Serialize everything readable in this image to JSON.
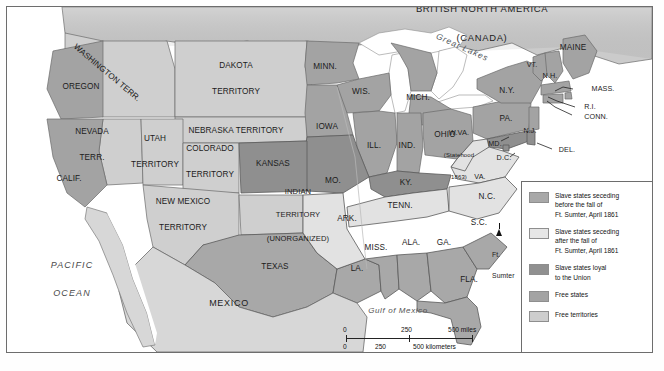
{
  "figure": {
    "title_alt": "The United States on the Eve of the Civil War, 1861"
  },
  "colors": {
    "seceded_before": "#a8a8a8",
    "seceded_after": "#e2e2e2",
    "loyal_slave": "#8f8f8f",
    "free_states": "#a3a3a3",
    "free_territories": "#cfcfcf",
    "water": "#ffffff",
    "mexico": "#d7d7d7",
    "canada": "#cccccc",
    "border": "#5a5a5a",
    "text": "#1b1b1b"
  },
  "countries": [
    {
      "name": "british-north-america",
      "line1": "BRITISH NORTH AMERICA",
      "line2": "(CANADA)"
    },
    {
      "name": "mexico",
      "label": "MEXICO"
    }
  ],
  "water_labels": [
    {
      "name": "pacific-ocean",
      "line1": "PACIFIC",
      "line2": "OCEAN"
    },
    {
      "name": "atlantic-ocean",
      "line1": "ATLANTIC",
      "line2": "OCEAN"
    },
    {
      "name": "gulf-of-mexico",
      "label": "Gulf of Mexico"
    },
    {
      "name": "great-lakes",
      "label": "Great Lakes"
    }
  ],
  "territories": [
    {
      "name": "washington-territory",
      "label": "WASHINGTON TERR."
    },
    {
      "name": "dakota-territory",
      "line1": "DAKOTA",
      "line2": "TERRITORY"
    },
    {
      "name": "nebraska-territory",
      "label": "NEBRASKA TERRITORY"
    },
    {
      "name": "nevada-territory",
      "line1": "NEVADA",
      "line2": "TERR."
    },
    {
      "name": "utah-territory",
      "line1": "UTAH",
      "line2": "TERRITORY"
    },
    {
      "name": "colorado-territory",
      "line1": "COLORADO",
      "line2": "TERRITORY"
    },
    {
      "name": "new-mexico-territory",
      "line1": "NEW MEXICO",
      "line2": "TERRITORY"
    },
    {
      "name": "indian-territory",
      "line1": "INDIAN",
      "line2": "TERRITORY",
      "line3": "(UNORGANIZED)"
    }
  ],
  "states": [
    {
      "name": "oregon",
      "label": "OREGON"
    },
    {
      "name": "california",
      "label": "CALIF."
    },
    {
      "name": "minnesota",
      "label": "MINN."
    },
    {
      "name": "wisconsin",
      "label": "WIS."
    },
    {
      "name": "michigan",
      "label": "MICH."
    },
    {
      "name": "iowa",
      "label": "IOWA"
    },
    {
      "name": "illinois",
      "label": "ILL."
    },
    {
      "name": "indiana",
      "label": "IND."
    },
    {
      "name": "ohio",
      "label": "OHIO"
    },
    {
      "name": "pennsylvania",
      "label": "PA."
    },
    {
      "name": "new-york",
      "label": "N.Y."
    },
    {
      "name": "maine",
      "label": "MAINE"
    },
    {
      "name": "vermont",
      "label": "VT."
    },
    {
      "name": "new-hampshire",
      "label": "N.H."
    },
    {
      "name": "massachusetts",
      "label": "MASS."
    },
    {
      "name": "rhode-island",
      "label": "R.I."
    },
    {
      "name": "connecticut",
      "label": "CONN."
    },
    {
      "name": "new-jersey",
      "label": "N.J."
    },
    {
      "name": "delaware",
      "label": "DEL."
    },
    {
      "name": "maryland",
      "label": "MD."
    },
    {
      "name": "district-of-columbia",
      "label": "D.C."
    },
    {
      "name": "west-virginia",
      "line1": "W.VA.",
      "line2": "(Statehood",
      "line3": "1863)"
    },
    {
      "name": "virginia",
      "label": "VA."
    },
    {
      "name": "kentucky",
      "label": "KY."
    },
    {
      "name": "missouri",
      "label": "MO."
    },
    {
      "name": "kansas",
      "label": "KANSAS"
    },
    {
      "name": "arkansas",
      "label": "ARK."
    },
    {
      "name": "tennessee",
      "label": "TENN."
    },
    {
      "name": "north-carolina",
      "label": "N.C."
    },
    {
      "name": "south-carolina",
      "label": "S.C."
    },
    {
      "name": "georgia",
      "label": "GA."
    },
    {
      "name": "alabama",
      "label": "ALA."
    },
    {
      "name": "mississippi",
      "label": "MISS."
    },
    {
      "name": "louisiana",
      "label": "LA."
    },
    {
      "name": "texas",
      "label": "TEXAS"
    },
    {
      "name": "florida",
      "label": "FLA."
    }
  ],
  "markers": [
    {
      "name": "ft-sumter",
      "line1": "Ft.",
      "line2": "Sumter"
    }
  ],
  "legend": {
    "items": [
      {
        "swatch": "#a8a8a8",
        "line1": "Slave states seceding",
        "line2": "before the fall of",
        "line3": "Ft. Sumter, April 1861"
      },
      {
        "swatch": "#e6e6e6",
        "line1": "Slave states seceding",
        "line2": "after the fall of",
        "line3": "Ft. Sumter, April 1861"
      },
      {
        "swatch": "#909090",
        "line1": "Slave states loyal",
        "line2": "to the Union"
      },
      {
        "swatch": "#a3a3a3",
        "line1": "Free states"
      },
      {
        "swatch": "#cdcdcd",
        "line1": "Free territories"
      }
    ]
  },
  "scale": {
    "miles": {
      "zero": "0",
      "mid": "250",
      "end": "500 miles"
    },
    "kilometers": {
      "zero": "0",
      "mid": "250",
      "end": "500 kilometers"
    }
  }
}
